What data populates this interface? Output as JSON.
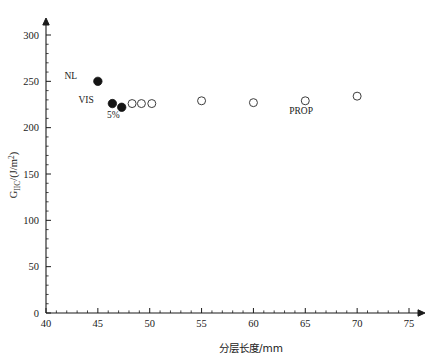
{
  "chart_data": {
    "type": "scatter",
    "title": "",
    "xlabel": "分层长度/mm",
    "ylabel": "G_IIC/(J/m^2)",
    "ylabel_main": "G",
    "ylabel_sub": "IIC",
    "ylabel_unit_pre": "/(J/m",
    "ylabel_unit_sup": "2",
    "ylabel_unit_post": ")",
    "xlim": [
      40,
      75
    ],
    "ylim": [
      0,
      320
    ],
    "x_ticks": [
      40,
      45,
      50,
      55,
      60,
      65,
      70,
      75
    ],
    "x_tick_labels": [
      "40",
      "45",
      "50",
      "55",
      "60",
      "65",
      "70",
      "75"
    ],
    "x_minor_step": 1,
    "y_ticks": [
      0,
      50,
      100,
      150,
      200,
      250,
      300
    ],
    "y_tick_labels": [
      "0",
      "50",
      "100",
      "150",
      "200",
      "250",
      "300"
    ],
    "y_minor_step": 10,
    "grid": false,
    "legend_position": "none",
    "marker_color_filled": "#141414",
    "marker_color_open": "#3c3c3c",
    "axis_color": "#1a1a1a",
    "series": [
      {
        "name": "NL",
        "marker": "filled-circle",
        "points": [
          {
            "x": 45.0,
            "y": 250
          }
        ]
      },
      {
        "name": "VIS / 5%",
        "marker": "filled-circle",
        "points": [
          {
            "x": 46.4,
            "y": 226
          },
          {
            "x": 47.3,
            "y": 222
          }
        ]
      },
      {
        "name": "PROP",
        "marker": "open-circle",
        "points": [
          {
            "x": 48.3,
            "y": 226
          },
          {
            "x": 49.2,
            "y": 226
          },
          {
            "x": 50.2,
            "y": 226
          },
          {
            "x": 55.0,
            "y": 229
          },
          {
            "x": 60.0,
            "y": 227
          },
          {
            "x": 65.0,
            "y": 229
          },
          {
            "x": 70.0,
            "y": 234
          }
        ]
      }
    ],
    "annotations": [
      {
        "text": "NL",
        "x": 43.0,
        "y": 252,
        "anchor": "end"
      },
      {
        "text": "VIS",
        "x": 44.6,
        "y": 227,
        "anchor": "end"
      },
      {
        "text": "5%",
        "x": 46.5,
        "y": 210,
        "anchor": "middle"
      },
      {
        "text": "PROP",
        "x": 64.6,
        "y": 215,
        "anchor": "middle"
      }
    ]
  }
}
